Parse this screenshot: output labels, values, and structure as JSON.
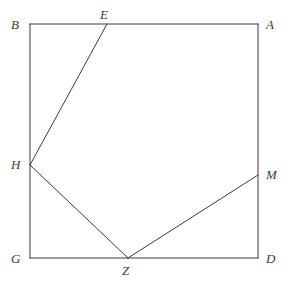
{
  "figure": {
    "background_color": "#ffffff",
    "stroke_color": "#3a3a3a",
    "stroke_width": 1,
    "label_color": "#3a3a3a",
    "width": 290,
    "height": 294,
    "square": {
      "name": "ABDG",
      "left": 30,
      "top": 24,
      "right": 258,
      "bottom": 258
    },
    "points": [
      {
        "id": "B",
        "label": "B",
        "x": 30,
        "y": 24,
        "label_x": 11,
        "label_y": 18,
        "on": "top-left-corner"
      },
      {
        "id": "E",
        "label": "E",
        "x": 107,
        "y": 24,
        "label_x": 100,
        "label_y": 8,
        "on": "top-edge"
      },
      {
        "id": "A",
        "label": "A",
        "x": 258,
        "y": 24,
        "label_x": 266,
        "label_y": 18,
        "on": "top-right-corner"
      },
      {
        "id": "H",
        "label": "H",
        "x": 30,
        "y": 165,
        "label_x": 11,
        "label_y": 158,
        "on": "left-edge"
      },
      {
        "id": "M",
        "label": "M",
        "x": 258,
        "y": 175,
        "label_x": 266,
        "label_y": 168,
        "on": "right-edge"
      },
      {
        "id": "G",
        "label": "G",
        "x": 30,
        "y": 258,
        "label_x": 11,
        "label_y": 252,
        "on": "bottom-left-corner"
      },
      {
        "id": "Z",
        "label": "Z",
        "x": 128,
        "y": 258,
        "label_x": 122,
        "label_y": 264,
        "on": "bottom-edge"
      },
      {
        "id": "D",
        "label": "D",
        "x": 258,
        "y": 258,
        "label_x": 266,
        "label_y": 252,
        "on": "bottom-right-corner"
      }
    ],
    "segments": [
      {
        "id": "EH",
        "from": "E",
        "to": "H",
        "x1": 107,
        "y1": 24,
        "x2": 30,
        "y2": 165
      },
      {
        "id": "HZ",
        "from": "H",
        "to": "Z",
        "x1": 30,
        "y1": 165,
        "x2": 128,
        "y2": 258
      },
      {
        "id": "ZM",
        "from": "Z",
        "to": "M",
        "x1": 128,
        "y1": 258,
        "x2": 258,
        "y2": 175
      }
    ],
    "caption": {
      "text": "",
      "visible": false,
      "note": "cut off at bottom edge"
    }
  }
}
